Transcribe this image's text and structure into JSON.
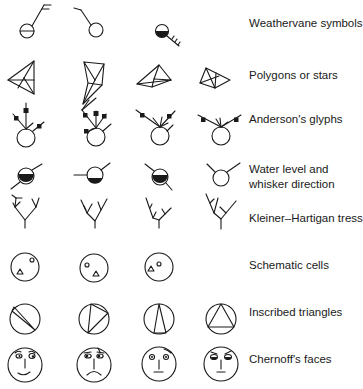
{
  "figure": {
    "rows": [
      {
        "id": "weathervane",
        "label": "Weathervane symbols",
        "label_lines": [
          "Weathervane symbols"
        ],
        "glyph_count": 3
      },
      {
        "id": "polygons",
        "label": "Polygons or stars",
        "label_lines": [
          "Polygons or stars"
        ],
        "glyph_count": 4
      },
      {
        "id": "anderson",
        "label": "Anderson's glyphs",
        "label_lines": [
          "Anderson's glyphs"
        ],
        "glyph_count": 4
      },
      {
        "id": "water-level",
        "label": "Water level and whisker direction",
        "label_lines": [
          "Water level and",
          "whisker direction"
        ],
        "glyph_count": 4
      },
      {
        "id": "kleiner-hartigan",
        "label": "Kleiner–Hartigan tress",
        "label_lines": [
          "Kleiner–Hartigan tress"
        ],
        "glyph_count": 4
      },
      {
        "id": "schematic-cells",
        "label": "Schematic cells",
        "label_lines": [
          "Schematic cells"
        ],
        "glyph_count": 3
      },
      {
        "id": "inscribed-triangles",
        "label": "Inscribed triangles",
        "label_lines": [
          "Inscribed triangles"
        ],
        "glyph_count": 4
      },
      {
        "id": "chernoff",
        "label": "Chernoff's faces",
        "label_lines": [
          "Chernoff's faces"
        ],
        "glyph_count": 4
      }
    ],
    "colors": {
      "ink": "#1a1a1a",
      "background": "#ffffff"
    }
  }
}
